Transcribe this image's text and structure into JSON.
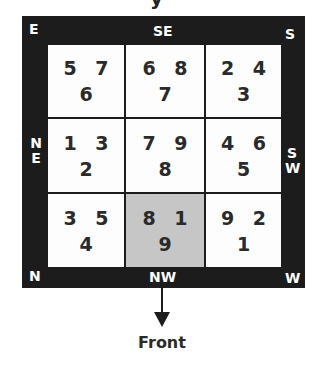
{
  "header_fragment": "y",
  "directions": {
    "top_left": "E",
    "top_center": "SE",
    "top_right": "S",
    "middle_left": "NE",
    "middle_right": "SW",
    "bottom_left": "N",
    "bottom_center": "NW",
    "bottom_right": "W"
  },
  "grid": {
    "rows": [
      [
        {
          "top": "5 7",
          "bottom": "6",
          "highlight": false
        },
        {
          "top": "6 8",
          "bottom": "7",
          "highlight": false
        },
        {
          "top": "2 4",
          "bottom": "3",
          "highlight": false
        }
      ],
      [
        {
          "top": "1 3",
          "bottom": "2",
          "highlight": false
        },
        {
          "top": "7 9",
          "bottom": "8",
          "highlight": false
        },
        {
          "top": "4 6",
          "bottom": "5",
          "highlight": false
        }
      ],
      [
        {
          "top": "3 5",
          "bottom": "4",
          "highlight": false
        },
        {
          "top": "8 1",
          "bottom": "9",
          "highlight": true
        },
        {
          "top": "9 2",
          "bottom": "1",
          "highlight": false
        }
      ]
    ]
  },
  "arrow_label": "Front",
  "colors": {
    "frame": "#1c1c1c",
    "cell": "#fdfdfd",
    "highlight_cell": "#c6c6c6",
    "label_text": "#ffffff",
    "number_text": "#2a2a2a"
  }
}
